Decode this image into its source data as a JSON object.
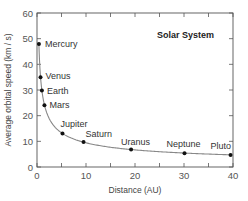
{
  "chart_data": {
    "type": "scatter",
    "title": "Solar System",
    "xlabel": "Distance (AU)",
    "ylabel": "Average orbital speed (km / s)",
    "xlim": [
      0,
      40
    ],
    "ylim": [
      0,
      60
    ],
    "xticks": [
      0,
      10,
      20,
      30,
      40
    ],
    "yticks": [
      0,
      10,
      20,
      30,
      40,
      50,
      60
    ],
    "grid": false,
    "legend": "none",
    "fit_curve": "v ∝ 1/sqrt(r)",
    "points": [
      {
        "name": "Mercury",
        "x": 0.39,
        "y": 47.9
      },
      {
        "name": "Venus",
        "x": 0.72,
        "y": 35.0
      },
      {
        "name": "Earth",
        "x": 1.0,
        "y": 29.8
      },
      {
        "name": "Mars",
        "x": 1.52,
        "y": 24.1
      },
      {
        "name": "Jupiter",
        "x": 5.2,
        "y": 13.1
      },
      {
        "name": "Saturn",
        "x": 9.5,
        "y": 9.7
      },
      {
        "name": "Uranus",
        "x": 19.2,
        "y": 6.8
      },
      {
        "name": "Neptune",
        "x": 30.1,
        "y": 5.4
      },
      {
        "name": "Pluto",
        "x": 39.5,
        "y": 4.7
      }
    ]
  },
  "colors": {
    "axis": "#555555",
    "curve": "#888888",
    "point": "#111111"
  }
}
